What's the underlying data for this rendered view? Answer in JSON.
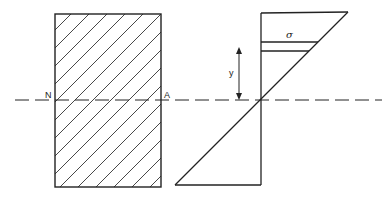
{
  "diagram": {
    "cross_section": {
      "shape": "rectangle",
      "fill": "diagonal hatching",
      "neutral_axis_labels": {
        "left": "N",
        "right": "A"
      }
    },
    "stress_diagram": {
      "shape": "linear stress distribution (two triangles meeting at neutral axis)",
      "stress_label": "σ",
      "distance_label": "y"
    },
    "neutral_axis": {
      "style": "dashed",
      "spans": "both figures"
    },
    "colors": {
      "stroke": "#222222",
      "background": "#ffffff"
    }
  }
}
